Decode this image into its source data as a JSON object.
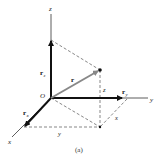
{
  "figure": {
    "caption": "(a)",
    "origin_label": "O",
    "axes": {
      "x": "x",
      "y": "y",
      "z": "z"
    },
    "vectors": {
      "r": "r",
      "r_x": "r",
      "r_x_sub": "x",
      "r_y": "r",
      "r_y_sub": "y",
      "r_z": "r",
      "r_z_sub": "z"
    },
    "dimension_labels": {
      "x": "x",
      "y": "y",
      "z": "z"
    },
    "colors": {
      "axis": "#333333",
      "component_vector": "#111111",
      "position_vector": "#888888",
      "dashed": "#555555"
    }
  }
}
